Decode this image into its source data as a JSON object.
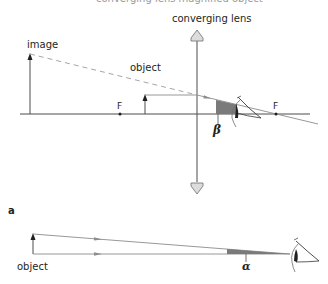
{
  "figure": {
    "top_caption_cut": "converging lens magnified object",
    "upper": {
      "lens_label": "converging lens",
      "image_label": "image",
      "object_label": "object",
      "focal_left_label": "F",
      "focal_right_label": "F",
      "angle_label": "β"
    },
    "lower": {
      "panel_label": "a",
      "object_label": "object",
      "angle_label": "α"
    },
    "colors": {
      "line": "#4d4d4d",
      "ray": "#8c8c8c",
      "dashed_ray": "#a6a6a6",
      "angle_fill": "#7a7a7a",
      "lens_fill": "#dcdcdc",
      "text": "#231f20"
    }
  }
}
